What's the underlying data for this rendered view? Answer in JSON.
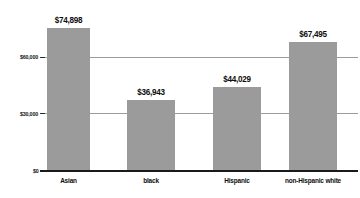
{
  "chart_data": {
    "type": "bar",
    "title": "",
    "subtitle": "",
    "xlabel": "",
    "ylabel": "",
    "categories": [
      "Asian",
      "black",
      "Hispanic",
      "non-Hispanic white"
    ],
    "values": [
      74898,
      36943,
      44029,
      67495
    ],
    "value_labels": [
      "$74,898",
      "$36,943",
      "$44,029",
      "$67,495"
    ],
    "ylim": [
      0,
      78000
    ],
    "yticks": [
      0,
      30000,
      60000
    ],
    "ytick_labels": [
      "$0",
      "$30,000",
      "$60,000"
    ],
    "grid": true,
    "gridlines_at": [
      30000,
      60000
    ],
    "legend": false,
    "legend_position": "none",
    "bar_color": "#9b9b9b",
    "gridline_color": "#9c9c9c",
    "axis_color": "#1a1a1a",
    "text_color": "#0d0d0d",
    "background": "#ffffff"
  }
}
